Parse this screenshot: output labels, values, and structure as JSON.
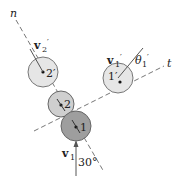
{
  "diagram": {
    "axes": {
      "normal_label": "n",
      "tangent_label": "t"
    },
    "balls": [
      {
        "id": "2prime",
        "label": "2′",
        "fill": "#e6e6e6"
      },
      {
        "id": "2",
        "label": "2",
        "fill": "#cfcfcf"
      },
      {
        "id": "1",
        "label": "1",
        "fill": "#9e9e9e"
      },
      {
        "id": "1prime",
        "label": "1′",
        "fill": "#e6e6e6"
      }
    ],
    "vectors": {
      "v1": {
        "label_main": "v",
        "label_sub": "1"
      },
      "v2_prime": {
        "label_main": "v",
        "label_sub": "2",
        "prime": "′"
      },
      "v1_prime": {
        "label_main": "v",
        "label_sub": "1",
        "prime": "′"
      }
    },
    "angles": {
      "incident": "30°",
      "theta1_prime": {
        "symbol": "θ",
        "sub": "1",
        "prime": "′"
      }
    },
    "colors": {
      "line": "#555555",
      "dash": "#777777"
    }
  }
}
